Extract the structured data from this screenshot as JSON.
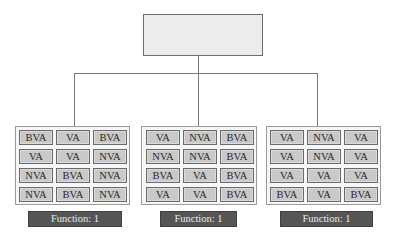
{
  "diagram": {
    "root": {
      "label": ""
    },
    "groups": [
      {
        "cells": [
          [
            "BVA",
            "VA",
            "BVA"
          ],
          [
            "VA",
            "VA",
            "NVA"
          ],
          [
            "NVA",
            "BVA",
            "NVA"
          ],
          [
            "NVA",
            "BVA",
            "NVA"
          ]
        ],
        "function_label": "Function: 1"
      },
      {
        "cells": [
          [
            "VA",
            "NVA",
            "BVA"
          ],
          [
            "NVA",
            "NVA",
            "BVA"
          ],
          [
            "BVA",
            "VA",
            "BVA"
          ],
          [
            "VA",
            "VA",
            "BVA"
          ]
        ],
        "function_label": "Function: 1"
      },
      {
        "cells": [
          [
            "VA",
            "NVA",
            "VA"
          ],
          [
            "VA",
            "NVA",
            "VA"
          ],
          [
            "VA",
            "VA",
            "VA"
          ],
          [
            "BVA",
            "VA",
            "BVA"
          ]
        ],
        "function_label": "Function: 1"
      }
    ]
  },
  "colors": {
    "cell_fill": "#c9c9c9",
    "label_fill": "#555555",
    "root_fill": "#ececec",
    "line": "#7a7a7a"
  }
}
